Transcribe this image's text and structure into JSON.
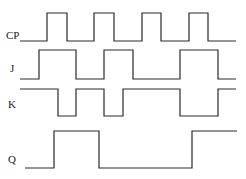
{
  "colors": {
    "line": "#2a2a2a",
    "text": "#1a1a1a",
    "background": "#ffffff"
  },
  "signals": [
    {
      "name": "CP",
      "label": "CP",
      "label_pos": [
        6,
        39
      ],
      "points": "20,41 47,41 47,13 67,13 67,41 94,41 94,13 114,13 114,41 142,41 142,13 161,13 161,41 189,41 189,13 208,13 208,41 236,41"
    },
    {
      "name": "J",
      "label": "J",
      "label_pos": [
        10,
        72
      ],
      "points": "20,79 39,79 39,50 76,50 76,79 104,79 104,50 133,50 133,79 180,79 180,50 218,50 218,79 236,79"
    },
    {
      "name": "K",
      "label": "K",
      "label_pos": [
        8,
        108
      ],
      "points": "20,89 58,89 58,116 76,116 76,89 104,89 104,116 123,116 123,89 180,89 180,116 218,116 218,89 236,89"
    },
    {
      "name": "Q",
      "label": "Q",
      "label_pos": [
        8,
        163
      ],
      "points": "25,168 54,168 54,131 99,131 99,168 192,168 192,131 237,131"
    }
  ]
}
